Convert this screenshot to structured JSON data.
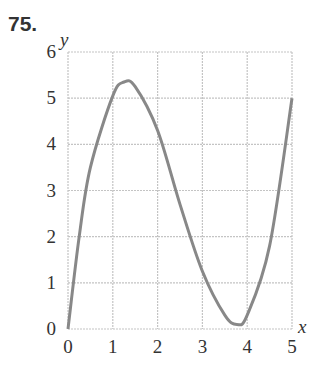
{
  "problem_number": "75.",
  "chart_data": {
    "type": "line",
    "title": "",
    "xlabel": "x",
    "ylabel": "y",
    "xlim": [
      0,
      5
    ],
    "ylim": [
      0,
      6
    ],
    "x_ticks": [
      "0",
      "1",
      "2",
      "3",
      "4",
      "5"
    ],
    "y_ticks": [
      "0",
      "1",
      "2",
      "3",
      "4",
      "5",
      "6"
    ],
    "grid": true,
    "series": [
      {
        "name": "curve",
        "color": "#888888",
        "x": [
          0,
          0.25,
          0.5,
          1,
          1.25,
          1.5,
          2,
          2.5,
          3,
          3.5,
          3.77,
          4,
          4.5,
          5
        ],
        "values": [
          0,
          2.0,
          3.5,
          5.05,
          5.35,
          5.25,
          4.3,
          2.7,
          1.25,
          0.3,
          0.1,
          0.3,
          1.8,
          5
        ]
      }
    ]
  }
}
